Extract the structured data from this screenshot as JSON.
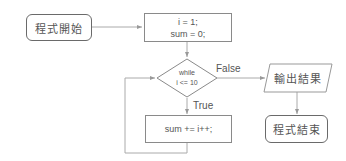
{
  "flowchart": {
    "start": {
      "label": "程式開始"
    },
    "init": {
      "line1": "i = 1;",
      "line2": "sum = 0;"
    },
    "condition": {
      "line1": "while",
      "line2": "i <= 10"
    },
    "false_label": "False",
    "true_label": "True",
    "body": {
      "label": "sum += i++;"
    },
    "output": {
      "label": "輸出結果"
    },
    "end": {
      "label": "程式結束"
    }
  },
  "colors": {
    "line": "#999999",
    "border": "#8a8a8a",
    "text": "#555555"
  }
}
